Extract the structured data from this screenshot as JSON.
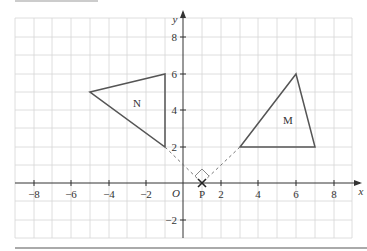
{
  "axes": {
    "x_label": "x",
    "y_label": "y",
    "origin_label": "O",
    "x_ticks": [
      "−8",
      "−6",
      "−4",
      "−2",
      "2",
      "4",
      "6",
      "8"
    ],
    "y_ticks": [
      "8",
      "6",
      "4",
      "2",
      "−2"
    ]
  },
  "shapes": {
    "triangle_N": {
      "label": "N",
      "vertices": [
        [
          -5,
          5
        ],
        [
          -1,
          6
        ],
        [
          -1,
          2
        ]
      ]
    },
    "triangle_M": {
      "label": "M",
      "vertices": [
        [
          3,
          2
        ],
        [
          6,
          6
        ],
        [
          7,
          2
        ]
      ]
    }
  },
  "point_P": {
    "label": "P",
    "x": 1,
    "y": 0
  },
  "colors": {
    "grid": "#d6d6d6",
    "axis": "#333333",
    "shape": "#555555",
    "dashed": "#777777"
  }
}
